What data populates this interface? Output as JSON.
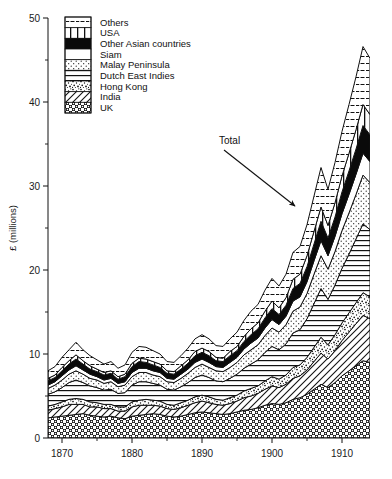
{
  "chart_data": {
    "type": "area",
    "stacked": true,
    "title": "",
    "subtitle": "",
    "xlabel": "",
    "ylabel": "£ (millions)",
    "xlim": [
      1868,
      1914
    ],
    "ylim": [
      0,
      50
    ],
    "grid": false,
    "legend_position": "top-left",
    "x_ticks": [
      1870,
      1880,
      1890,
      1900,
      1910
    ],
    "x_minor_ticks": [
      1875,
      1885,
      1895,
      1905
    ],
    "y_ticks": [
      0,
      10,
      20,
      30,
      40,
      50
    ],
    "y_minor_ticks": [
      5,
      15,
      25,
      35,
      45
    ],
    "annotations": [
      {
        "text": "Total",
        "x": 1895,
        "y": 36,
        "arrow_to_x": 1903,
        "arrow_to_y": 27
      }
    ],
    "x": [
      1868,
      1869,
      1870,
      1871,
      1872,
      1873,
      1874,
      1875,
      1876,
      1877,
      1878,
      1879,
      1880,
      1881,
      1882,
      1883,
      1884,
      1885,
      1886,
      1887,
      1888,
      1889,
      1890,
      1891,
      1892,
      1893,
      1894,
      1895,
      1896,
      1897,
      1898,
      1899,
      1900,
      1901,
      1902,
      1903,
      1904,
      1905,
      1906,
      1907,
      1908,
      1909,
      1910,
      1911,
      1912,
      1913,
      1914
    ],
    "series": [
      {
        "name": "UK",
        "pattern": "checker-dots",
        "values": [
          2.4,
          2.5,
          2.6,
          2.7,
          2.8,
          2.9,
          2.7,
          2.6,
          2.5,
          2.6,
          2.4,
          2.3,
          2.6,
          2.7,
          2.8,
          2.9,
          2.8,
          2.6,
          2.5,
          2.6,
          2.8,
          3.0,
          3.1,
          3.0,
          2.9,
          2.8,
          2.9,
          3.1,
          3.3,
          3.4,
          3.6,
          3.9,
          4.1,
          4.0,
          4.2,
          4.6,
          4.8,
          5.2,
          5.8,
          6.4,
          6.0,
          6.6,
          7.4,
          8.0,
          8.6,
          9.2,
          9.0
        ]
      },
      {
        "name": "India",
        "pattern": "diagonal-hatch",
        "values": [
          0.9,
          1.0,
          1.1,
          1.3,
          1.2,
          1.1,
          1.0,
          1.1,
          1.0,
          0.9,
          0.8,
          0.9,
          1.1,
          1.2,
          1.1,
          1.0,
          1.0,
          0.9,
          0.9,
          1.0,
          1.1,
          1.2,
          1.3,
          1.2,
          1.1,
          1.1,
          1.2,
          1.3,
          1.5,
          1.6,
          1.7,
          1.9,
          2.1,
          2.0,
          2.2,
          2.5,
          2.6,
          2.9,
          3.3,
          3.7,
          3.4,
          3.8,
          4.2,
          4.6,
          5.0,
          5.4,
          5.2
        ]
      },
      {
        "name": "Hong Kong",
        "pattern": "stipple",
        "values": [
          0.5,
          0.5,
          0.6,
          0.6,
          0.7,
          0.6,
          0.6,
          0.5,
          0.5,
          0.5,
          0.5,
          0.5,
          0.6,
          0.6,
          0.7,
          0.6,
          0.6,
          0.5,
          0.5,
          0.6,
          0.6,
          0.7,
          0.7,
          0.7,
          0.6,
          0.6,
          0.7,
          0.7,
          0.8,
          0.9,
          0.9,
          1.0,
          1.1,
          1.0,
          1.1,
          1.3,
          1.3,
          1.5,
          1.7,
          1.9,
          1.7,
          1.9,
          2.1,
          2.3,
          2.5,
          2.7,
          2.6
        ]
      },
      {
        "name": "Dutch East Indies",
        "pattern": "horizontal-lines",
        "values": [
          1.4,
          1.5,
          1.7,
          2.0,
          2.2,
          2.0,
          1.9,
          1.8,
          1.7,
          1.8,
          1.6,
          1.7,
          2.0,
          2.2,
          2.1,
          2.0,
          1.9,
          1.8,
          1.8,
          1.9,
          2.1,
          2.3,
          2.4,
          2.3,
          2.2,
          2.2,
          2.3,
          2.5,
          2.7,
          2.9,
          3.1,
          3.4,
          3.6,
          3.5,
          3.7,
          4.1,
          4.2,
          4.6,
          5.2,
          5.8,
          5.4,
          5.9,
          6.5,
          7.0,
          7.6,
          8.2,
          8.0
        ]
      },
      {
        "name": "Malay Peninsula",
        "pattern": "fine-dots",
        "values": [
          0.7,
          0.8,
          0.9,
          1.0,
          1.1,
          1.0,
          0.9,
          0.9,
          0.8,
          0.9,
          0.8,
          0.9,
          1.0,
          1.1,
          1.1,
          1.0,
          1.0,
          0.9,
          0.9,
          1.0,
          1.1,
          1.2,
          1.3,
          1.2,
          1.2,
          1.2,
          1.3,
          1.4,
          1.6,
          1.7,
          1.8,
          2.0,
          2.2,
          2.1,
          2.3,
          2.6,
          2.7,
          3.0,
          3.5,
          3.9,
          3.6,
          4.0,
          4.5,
          4.9,
          5.3,
          5.8,
          5.6
        ]
      },
      {
        "name": "Siam",
        "pattern": "white",
        "values": [
          0.4,
          0.4,
          0.5,
          0.5,
          0.6,
          0.5,
          0.5,
          0.4,
          0.4,
          0.4,
          0.4,
          0.4,
          0.5,
          0.5,
          0.5,
          0.5,
          0.5,
          0.4,
          0.4,
          0.5,
          0.5,
          0.6,
          0.6,
          0.6,
          0.5,
          0.5,
          0.6,
          0.6,
          0.7,
          0.8,
          0.8,
          0.9,
          1.0,
          0.9,
          1.0,
          1.2,
          1.2,
          1.4,
          1.6,
          1.8,
          1.6,
          1.8,
          2.0,
          2.2,
          2.4,
          2.6,
          2.5
        ]
      },
      {
        "name": "Other Asian countries",
        "pattern": "solid-black",
        "values": [
          0.5,
          0.5,
          0.6,
          0.7,
          0.8,
          0.7,
          0.6,
          0.6,
          0.6,
          0.6,
          0.5,
          0.6,
          0.7,
          0.8,
          0.7,
          0.7,
          0.6,
          0.6,
          0.6,
          0.6,
          0.7,
          0.8,
          0.8,
          0.8,
          0.7,
          0.7,
          0.8,
          0.8,
          0.9,
          1.0,
          1.1,
          1.2,
          1.3,
          1.2,
          1.3,
          1.5,
          1.6,
          1.8,
          2.0,
          2.3,
          2.1,
          2.3,
          2.6,
          2.8,
          3.0,
          3.3,
          3.2
        ]
      },
      {
        "name": "USA",
        "pattern": "vertical-lines",
        "values": [
          0.3,
          0.3,
          0.4,
          0.4,
          0.5,
          0.4,
          0.4,
          0.3,
          0.3,
          0.3,
          0.3,
          0.3,
          0.4,
          0.4,
          0.4,
          0.4,
          0.4,
          0.3,
          0.3,
          0.4,
          0.4,
          0.5,
          0.5,
          0.5,
          0.4,
          0.4,
          0.5,
          0.5,
          0.6,
          0.7,
          0.7,
          0.8,
          0.9,
          0.8,
          0.9,
          1.1,
          1.1,
          1.3,
          1.5,
          1.7,
          1.5,
          1.7,
          1.9,
          2.1,
          2.3,
          2.5,
          2.4
        ]
      },
      {
        "name": "Others",
        "pattern": "dashed-lines",
        "values": [
          0.9,
          1.0,
          1.2,
          1.3,
          1.5,
          1.3,
          1.2,
          1.1,
          1.0,
          1.1,
          1.0,
          1.1,
          1.3,
          1.4,
          1.4,
          1.3,
          1.2,
          1.1,
          1.1,
          1.2,
          1.4,
          1.5,
          1.6,
          1.5,
          1.4,
          1.4,
          1.5,
          1.7,
          1.9,
          2.1,
          2.2,
          2.5,
          2.7,
          2.6,
          2.8,
          3.2,
          3.3,
          3.7,
          4.2,
          4.7,
          4.3,
          4.8,
          5.3,
          5.8,
          6.3,
          6.9,
          6.7
        ]
      }
    ]
  },
  "legend": {
    "items": [
      {
        "label": "Others"
      },
      {
        "label": "USA"
      },
      {
        "label": "Other Asian countries"
      },
      {
        "label": "Siam"
      },
      {
        "label": "Malay Peninsula"
      },
      {
        "label": "Dutch East Indies"
      },
      {
        "label": "Hong Kong"
      },
      {
        "label": "India"
      },
      {
        "label": "UK"
      }
    ]
  },
  "axis": {
    "y_title": "£ (millions)",
    "y_tick_labels": [
      "50",
      "40",
      "30",
      "20",
      "10",
      "0"
    ],
    "x_tick_labels": [
      "1870",
      "1880",
      "1890",
      "1900",
      "1910"
    ]
  },
  "annotation": {
    "total_label": "Total"
  },
  "colors": {
    "ink": "#111111",
    "background": "#ffffff"
  }
}
